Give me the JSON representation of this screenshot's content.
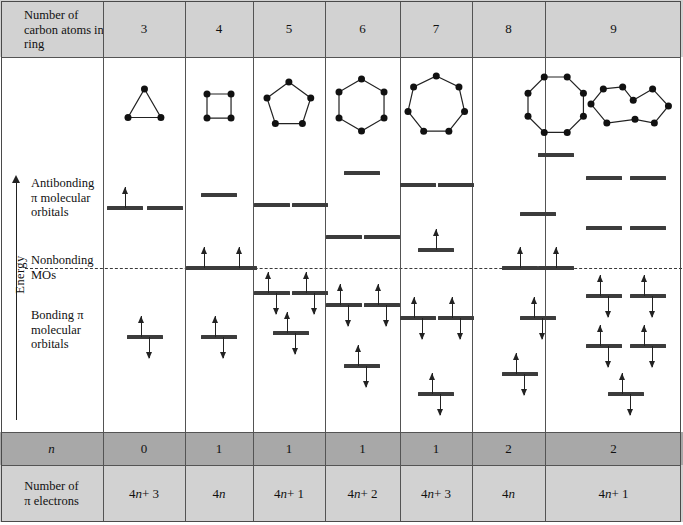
{
  "table": {
    "header_label": "Number of carbon atoms in ring",
    "n_row_label": "n",
    "electron_row_label": "Number of π electrons",
    "columns": [
      {
        "carbons": "3",
        "n": "0",
        "electrons": "4n + 3"
      },
      {
        "carbons": "4",
        "n": "1",
        "electrons": "4n"
      },
      {
        "carbons": "5",
        "n": "1",
        "electrons": "4n + 1"
      },
      {
        "carbons": "6",
        "n": "1",
        "electrons": "4n + 2"
      },
      {
        "carbons": "7",
        "n": "1",
        "electrons": "4n + 3"
      },
      {
        "carbons": "8",
        "n": "2",
        "electrons": "4n"
      },
      {
        "carbons": "9",
        "n": "2",
        "electrons": "4n + 1"
      }
    ]
  },
  "axis": {
    "energy_label": "Energy",
    "antibonding_label": "Antibonding π molecular orbitals",
    "nonbonding_label": "Nonbonding MOs",
    "bonding_label": "Bonding π molecular orbitals"
  },
  "colors": {
    "header_band": "#d2d2d2",
    "n_band": "#a8a8a8",
    "level": "#3c3c3c",
    "rule": "#545454",
    "arrow": "#222222"
  },
  "chart_data": {
    "type": "diagram",
    "ylabel": "Energy",
    "nonbonding_line_y": 268,
    "columns": [
      {
        "carbons": 3,
        "ring_sides": 3,
        "n": 0,
        "pi_electrons": "4n + 3",
        "levels": [
          {
            "y": 208,
            "x": 125,
            "electrons": 1
          },
          {
            "y": 208,
            "x": 165,
            "electrons": 0
          },
          {
            "y": 337,
            "x": 145,
            "electrons": 2
          }
        ]
      },
      {
        "carbons": 4,
        "ring_sides": 4,
        "n": 1,
        "pi_electrons": "4n",
        "levels": [
          {
            "y": 195,
            "x": 219,
            "electrons": 0
          },
          {
            "y": 268,
            "x": 204,
            "electrons": 1
          },
          {
            "y": 268,
            "x": 239,
            "electrons": 1
          },
          {
            "y": 337,
            "x": 219,
            "electrons": 2
          }
        ]
      },
      {
        "carbons": 5,
        "ring_sides": 5,
        "n": 1,
        "pi_electrons": "4n + 1",
        "levels": [
          {
            "y": 205,
            "x": 272,
            "electrons": 0
          },
          {
            "y": 205,
            "x": 310,
            "electrons": 0
          },
          {
            "y": 293,
            "x": 272,
            "electrons": 2
          },
          {
            "y": 293,
            "x": 310,
            "electrons": 2
          },
          {
            "y": 333,
            "x": 291,
            "electrons": 2
          }
        ]
      },
      {
        "carbons": 6,
        "ring_sides": 6,
        "n": 1,
        "pi_electrons": "4n + 2",
        "levels": [
          {
            "y": 173,
            "x": 362,
            "electrons": 0
          },
          {
            "y": 237,
            "x": 344,
            "electrons": 0
          },
          {
            "y": 237,
            "x": 382,
            "electrons": 0
          },
          {
            "y": 305,
            "x": 344,
            "electrons": 2
          },
          {
            "y": 305,
            "x": 382,
            "electrons": 2
          },
          {
            "y": 366,
            "x": 362,
            "electrons": 2
          }
        ]
      },
      {
        "carbons": 7,
        "ring_sides": 7,
        "n": 1,
        "pi_electrons": "4n + 3",
        "levels": [
          {
            "y": 185,
            "x": 418,
            "electrons": 0
          },
          {
            "y": 185,
            "x": 456,
            "electrons": 0
          },
          {
            "y": 250,
            "x": 436,
            "electrons": 1
          },
          {
            "y": 318,
            "x": 418,
            "electrons": 2
          },
          {
            "y": 318,
            "x": 456,
            "electrons": 2
          },
          {
            "y": 394,
            "x": 436,
            "electrons": 2
          }
        ]
      },
      {
        "carbons": 8,
        "ring_sides": 8,
        "n": 2,
        "pi_electrons": "4n",
        "levels": [
          {
            "y": 155,
            "x": 556,
            "electrons": 0
          },
          {
            "y": 214,
            "x": 538,
            "electrons": 0
          },
          {
            "y": 268,
            "x": 520,
            "electrons": 1
          },
          {
            "y": 268,
            "x": 556,
            "electrons": 1
          },
          {
            "y": 318,
            "x": 538,
            "electrons": 2
          },
          {
            "y": 374,
            "x": 520,
            "electrons": 2
          }
        ]
      },
      {
        "carbons": 9,
        "ring_sides": 9,
        "n": 2,
        "pi_electrons": "4n + 1",
        "levels": [
          {
            "y": 178,
            "x": 604,
            "electrons": 0
          },
          {
            "y": 178,
            "x": 648,
            "electrons": 0
          },
          {
            "y": 228,
            "x": 604,
            "electrons": 0
          },
          {
            "y": 228,
            "x": 648,
            "electrons": 0
          },
          {
            "y": 296,
            "x": 604,
            "electrons": 2
          },
          {
            "y": 296,
            "x": 648,
            "electrons": 2
          },
          {
            "y": 346,
            "x": 604,
            "electrons": 2
          },
          {
            "y": 346,
            "x": 648,
            "electrons": 2
          },
          {
            "y": 394,
            "x": 626,
            "electrons": 2
          }
        ]
      }
    ]
  }
}
